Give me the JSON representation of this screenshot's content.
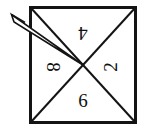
{
  "figure": {
    "type": "spinner-diagram",
    "title": "",
    "background_color": "#ffffff",
    "stroke_color": "#141414",
    "text_color": "#111111",
    "square": {
      "left": 29,
      "top": 6,
      "right": 137,
      "bottom": 124,
      "border_width": 3
    },
    "center": {
      "x": 83,
      "y": 65
    },
    "diagonals": {
      "count": 2,
      "stroke_width": 2,
      "description": "two diagonals of the square crossing at the center"
    },
    "sectors": [
      {
        "position": "top",
        "label": "4",
        "x": 83,
        "y": 31,
        "rotation_deg": 180
      },
      {
        "position": "right",
        "label": "2",
        "x": 113,
        "y": 67,
        "rotation_deg": -90
      },
      {
        "position": "left",
        "label": "8",
        "x": 51,
        "y": 67,
        "rotation_deg": 90
      },
      {
        "position": "bottom",
        "label": "6",
        "x": 83,
        "y": 103,
        "rotation_deg": 0
      }
    ],
    "pointer": {
      "name": "spinner-needle",
      "shape": "thin elongated arrow with open arrowhead",
      "tail_x": 83,
      "tail_y": 65,
      "tip_x": 11,
      "tip_y": 14,
      "direction": "up-left",
      "stroke_width": 1.6,
      "points_to_sector": "8"
    }
  }
}
